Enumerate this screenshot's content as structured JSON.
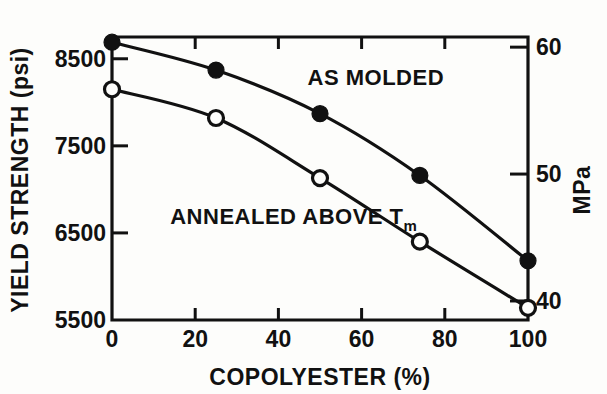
{
  "chart_data": {
    "type": "line",
    "title": "",
    "xlabel": "COPOLYESTER (%)",
    "ylabel": "YIELD STRENGTH (psi)",
    "y2label": "MPa",
    "xlim": [
      0,
      100
    ],
    "ylim": [
      5500,
      8750
    ],
    "y2lim": [
      38.5,
      60.8
    ],
    "xticks": [
      0,
      20,
      40,
      60,
      80,
      100
    ],
    "xtick_labels": [
      "0",
      "20",
      "40",
      "60",
      "80",
      "100"
    ],
    "yticks": [
      5500,
      6500,
      7500,
      8500
    ],
    "ytick_labels": [
      "5500",
      "6500",
      "7500",
      "8500"
    ],
    "y2ticks": [
      40,
      50,
      60
    ],
    "y2tick_labels": [
      "40",
      "50",
      "60"
    ],
    "grid": false,
    "legend_position": "inline-annotations",
    "annotations": [
      {
        "text": "AS MOLDED",
        "x": 47,
        "y": 8200
      },
      {
        "text": "ANNEALED ABOVE T",
        "subscript": "m",
        "x": 14,
        "y": 6600
      }
    ],
    "series": [
      {
        "name": "AS MOLDED",
        "marker": "filled-circle",
        "color": "#111111",
        "x": [
          0,
          25,
          50,
          74,
          100
        ],
        "values": [
          8690,
          8370,
          7870,
          7160,
          6180
        ]
      },
      {
        "name": "ANNEALED ABOVE Tm",
        "marker": "open-circle",
        "color": "#111111",
        "x": [
          0,
          25,
          50,
          74,
          100
        ],
        "values": [
          8150,
          7820,
          7130,
          6400,
          5640
        ]
      }
    ]
  },
  "figure": {
    "background": "#fdfdfb",
    "ink": "#111111"
  }
}
